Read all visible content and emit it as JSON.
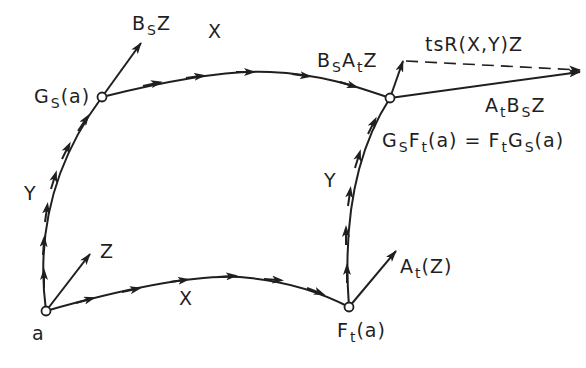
{
  "diagram": {
    "colors": {
      "ink": "#1f1f1f",
      "background": "#ffffff"
    },
    "nodes": {
      "a": {
        "label": "a"
      },
      "Gs_a": {
        "label_main": "G",
        "label_sub": "S",
        "label_tail": "(a)"
      },
      "Ft_a": {
        "label_main": "F",
        "label_sub": "t",
        "label_tail": "(a)"
      },
      "corner": {
        "label_lhs_1": "G",
        "label_lhs_1_sub": "S",
        "label_lhs_2": "F",
        "label_lhs_2_sub": "t",
        "label_lhs_tail": "(a) = ",
        "label_rhs_1": "F",
        "label_rhs_1_sub": "t",
        "label_rhs_2": "G",
        "label_rhs_2_sub": "S",
        "label_rhs_tail": "(a)"
      }
    },
    "edges": {
      "bottom_X": {
        "label": "X"
      },
      "top_X": {
        "label": "X"
      },
      "left_Y": {
        "label": "Y"
      },
      "right_Y": {
        "label": "Y"
      }
    },
    "vectors": {
      "Z": {
        "label": "Z"
      },
      "BsZ": {
        "main": "B",
        "sub": "S",
        "tail": "Z"
      },
      "AtZ": {
        "main": "A",
        "sub": "t",
        "tail": "(Z)"
      },
      "BsAtZ": {
        "m1": "B",
        "s1": "S",
        "m2": "A",
        "s2": "t",
        "tail": "Z"
      },
      "AtBsZ": {
        "m1": "A",
        "s1": "t",
        "m2": "B",
        "s2": "S",
        "tail": "Z"
      },
      "tsR": {
        "label": "tsR(X,Y)Z"
      }
    }
  }
}
